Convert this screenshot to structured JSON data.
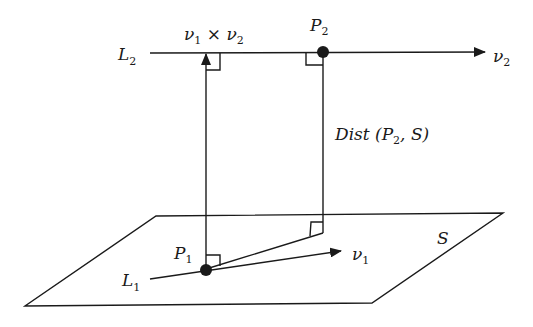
{
  "figure": {
    "labels": {
      "L2": {
        "main": "L",
        "sub": "2"
      },
      "L1": {
        "main": "L",
        "sub": "1"
      },
      "P2": {
        "main": "P",
        "sub": "2"
      },
      "P1": {
        "main": "P",
        "sub": "1"
      },
      "v2": {
        "main": "ν",
        "sub": "2"
      },
      "v1": {
        "main": "ν",
        "sub": "1"
      },
      "cross": {
        "a": "ν",
        "a_sub": "1",
        "op": " × ",
        "b": "ν",
        "b_sub": "2"
      },
      "dist": {
        "prefix": "Dist (P",
        "sub": "2",
        "suffix": ", S)"
      },
      "plane": "S"
    },
    "colors": {
      "ink": "#1a1a1a",
      "background": "#ffffff"
    }
  }
}
